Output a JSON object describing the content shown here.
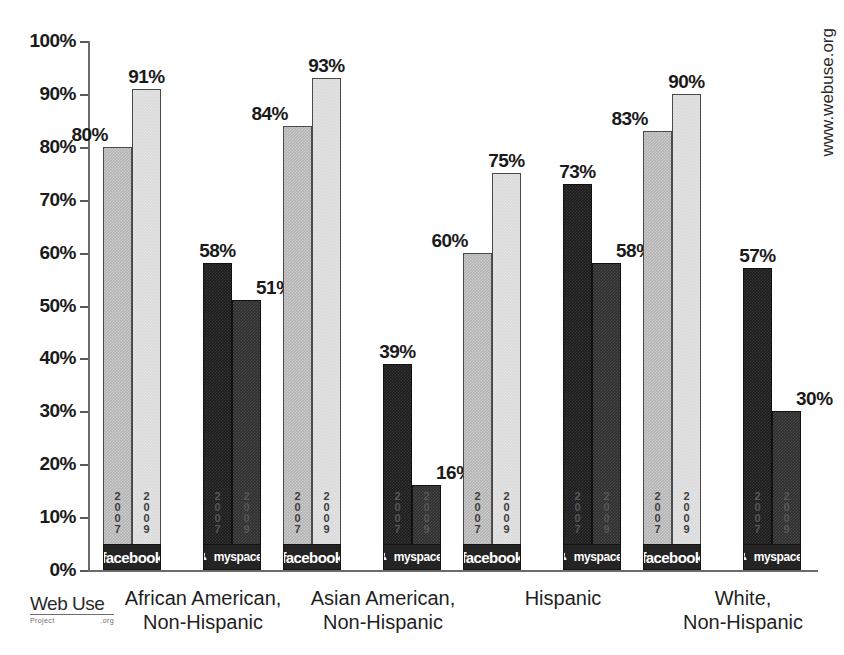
{
  "watermark": "www.webuse.org",
  "logo": {
    "main": "Web Use",
    "sub_left": "Project",
    "sub_right": ".org"
  },
  "brands": {
    "facebook_label": "facebook",
    "myspace_label": "myspace.",
    "myspace_glyph": "myspace-logo-icon"
  },
  "years": {
    "y2007": "2007",
    "y2009": "2009"
  },
  "chart_data": {
    "type": "bar",
    "title": "",
    "subtitle": "",
    "xlabel": "",
    "ylabel": "",
    "ylim": [
      0,
      100
    ],
    "yticks": [
      "0%",
      "10%",
      "20%",
      "30%",
      "40%",
      "50%",
      "60%",
      "70%",
      "80%",
      "90%",
      "100%"
    ],
    "ytick_values": [
      0,
      10,
      20,
      30,
      40,
      50,
      60,
      70,
      80,
      90,
      100
    ],
    "grid": false,
    "legend_position": "in-bar",
    "categories": [
      "African American,\nNon-Hispanic",
      "Asian American,\nNon-Hispanic",
      "Hispanic",
      "White,\nNon-Hispanic"
    ],
    "series": [
      {
        "name": "facebook 2007",
        "key": "fb07",
        "values": [
          80,
          84,
          60,
          83
        ],
        "labels": [
          "80%",
          "84%",
          "60%",
          "83%"
        ],
        "color": "#b4b4b4"
      },
      {
        "name": "facebook 2009",
        "key": "fb09",
        "values": [
          91,
          93,
          75,
          90
        ],
        "labels": [
          "91%",
          "93%",
          "75%",
          "90%"
        ],
        "color": "#d9d9d9"
      },
      {
        "name": "myspace 2007",
        "key": "ms07",
        "values": [
          58,
          39,
          73,
          57
        ],
        "labels": [
          "58%",
          "39%",
          "73%",
          "57%"
        ],
        "color": "#1d1d1d"
      },
      {
        "name": "myspace 2009",
        "key": "ms09",
        "values": [
          51,
          16,
          58,
          30
        ],
        "labels": [
          "51%",
          "16%",
          "58%",
          "30%"
        ],
        "color": "#2f2f2f"
      }
    ]
  }
}
